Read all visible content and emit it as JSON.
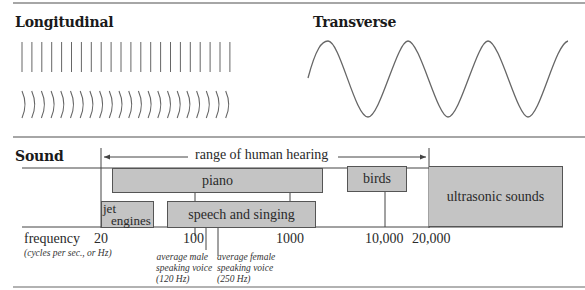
{
  "panels": {
    "longitudinal": {
      "title": "Longitudinal",
      "straight_line_count": 22,
      "arc_count": 22
    },
    "transverse": {
      "title": "Transverse",
      "cycles": 3.25
    }
  },
  "sound": {
    "title": "Sound",
    "range_label": "range of human hearing",
    "axis": {
      "label": "frequency",
      "unit_note": "(cycles per sec., or Hz)",
      "ticks": [
        "20",
        "100",
        "1000",
        "10,000",
        "20,000"
      ]
    },
    "bands": [
      {
        "id": "piano",
        "label": "piano"
      },
      {
        "id": "birds",
        "label": "birds"
      },
      {
        "id": "ultrasonic",
        "label": "ultrasonic sounds"
      },
      {
        "id": "jet",
        "label_line1": "jet",
        "label_line2": "engines"
      },
      {
        "id": "speech",
        "label": "speech and singing"
      }
    ],
    "annotations": {
      "male": {
        "line1": "average male",
        "line2": "speaking voice",
        "line3": "(120 Hz)"
      },
      "female": {
        "line1": "average female",
        "line2": "speaking voice",
        "line3": "(250 Hz)"
      }
    }
  },
  "colors": {
    "band_fill": "#c4c4c4",
    "line": "#555555",
    "rule": "#888888"
  }
}
